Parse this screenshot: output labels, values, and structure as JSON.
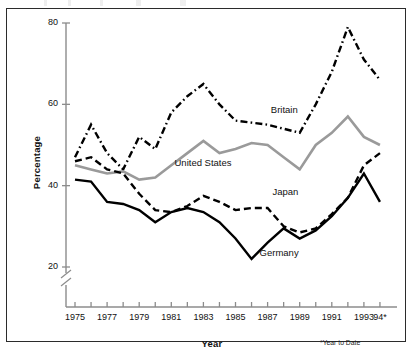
{
  "chart_data": {
    "type": "line",
    "title": "",
    "xlabel": "Year",
    "ylabel": "Percentage",
    "xlim": [
      1975,
      1994
    ],
    "ylim": [
      20,
      80
    ],
    "y_axis_break": true,
    "grid": false,
    "legend_position": "inline-annotations",
    "x": [
      1975,
      1976,
      1977,
      1978,
      1979,
      1980,
      1981,
      1982,
      1983,
      1984,
      1985,
      1986,
      1987,
      1988,
      1989,
      1990,
      1991,
      1992,
      1993,
      1994
    ],
    "x_tick_labels": [
      "1975",
      "",
      "1977",
      "",
      "1979",
      "",
      "1981",
      "",
      "1983",
      "",
      "1985",
      "",
      "1987",
      "",
      "1989",
      "",
      "1991",
      "",
      "1993",
      "94*"
    ],
    "y_tick_labels": [
      "20",
      "40",
      "60",
      "80"
    ],
    "y_ticks": [
      20,
      40,
      60,
      80
    ],
    "series": [
      {
        "name": "Britain",
        "color": "#000000",
        "style": "dash-dot",
        "label_x": 1987.2,
        "label_y": 58.5,
        "values": [
          47,
          55,
          48,
          44,
          52,
          49,
          58,
          62,
          65,
          60,
          56,
          55.5,
          55,
          54,
          53,
          60,
          68,
          79,
          71,
          66
        ]
      },
      {
        "name": "United States",
        "color": "#9a9a9a",
        "style": "solid",
        "label_x": 1981.2,
        "label_y": 45.5,
        "values": [
          45,
          44,
          43,
          43.5,
          41.5,
          42,
          45,
          48,
          51,
          48,
          49,
          50.5,
          50,
          47,
          44,
          50,
          53,
          57,
          52,
          50
        ]
      },
      {
        "name": "Japan",
        "color": "#000000",
        "style": "dashed",
        "label_x": 1987.3,
        "label_y": 38.5,
        "values": [
          46,
          47,
          44,
          43,
          38,
          34,
          33.5,
          35,
          37.5,
          36,
          34,
          34.5,
          34.5,
          30,
          28.5,
          29.5,
          33,
          37,
          45,
          48
        ]
      },
      {
        "name": "Germany",
        "color": "#000000",
        "style": "solid",
        "label_x": 1986.5,
        "label_y": 23.5,
        "values": [
          41.5,
          41,
          36,
          35.5,
          34,
          31,
          33.5,
          34.5,
          33.5,
          31,
          27,
          22,
          26,
          29.5,
          27,
          29,
          32.5,
          37,
          43,
          36
        ]
      }
    ],
    "footnote": "*Year to Date"
  }
}
